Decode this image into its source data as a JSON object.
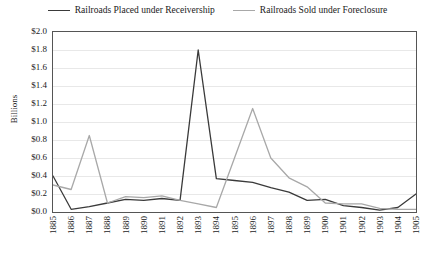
{
  "chart_data": {
    "type": "line",
    "title": "",
    "subtitle": "",
    "xlabel": "",
    "ylabel": "Billions",
    "ylim": [
      0.0,
      2.0
    ],
    "ytick_step": 0.2,
    "ytick_labels": [
      "$0.0",
      "$0.2",
      "$0.4",
      "$0.6",
      "$0.8",
      "$1.0",
      "$1.2",
      "$1.4",
      "$1.6",
      "$1.8",
      "$2.0"
    ],
    "ytick_values": [
      0.0,
      0.2,
      0.4,
      0.6,
      0.8,
      1.0,
      1.2,
      1.4,
      1.6,
      1.8,
      2.0
    ],
    "categories": [
      "1885",
      "1886",
      "1887",
      "1888",
      "1889",
      "1890",
      "1891",
      "1892",
      "1893",
      "1894",
      "1895",
      "1896",
      "1897",
      "1898",
      "1899",
      "1900",
      "1901",
      "1902",
      "1903",
      "1904",
      "1905"
    ],
    "grid": true,
    "grid_axis": "y",
    "legend_position": "top-center",
    "series": [
      {
        "name": "Railroads Placed under Receivership",
        "color": "#3a3a3a",
        "values": [
          0.4,
          0.03,
          0.06,
          0.1,
          0.14,
          0.13,
          0.15,
          0.13,
          1.8,
          0.37,
          0.35,
          0.33,
          0.27,
          0.22,
          0.13,
          0.14,
          0.07,
          0.05,
          0.02,
          0.05,
          0.2
        ]
      },
      {
        "name": "Railroads Sold under Foreclosure",
        "color": "#a8a8a8",
        "values": [
          0.3,
          0.25,
          0.85,
          0.1,
          0.17,
          0.16,
          0.18,
          0.13,
          0.09,
          0.05,
          0.6,
          1.15,
          0.6,
          0.38,
          0.28,
          0.1,
          0.09,
          0.09,
          0.04,
          0.03,
          0.03
        ]
      }
    ]
  },
  "legend": {
    "entries": [
      {
        "label": "Railroads Placed under Receivership"
      },
      {
        "label": "Railroads Sold under Foreclosure"
      }
    ]
  }
}
